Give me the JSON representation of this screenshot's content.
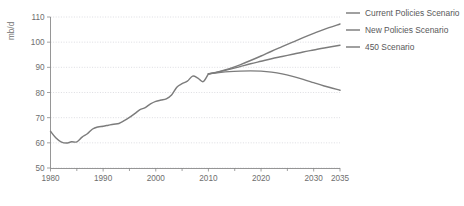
{
  "chart_data": {
    "type": "line",
    "title": "",
    "xlabel": "",
    "ylabel": "mb/d",
    "xlim": [
      1980,
      2035
    ],
    "ylim": [
      50,
      110
    ],
    "xticks": [
      1980,
      1990,
      2000,
      2010,
      2020,
      2030,
      2035
    ],
    "yticks": [
      50,
      60,
      70,
      80,
      90,
      100,
      110
    ],
    "xtick_labels": [
      "1980",
      "1990",
      "2000",
      "2010",
      "2020",
      "2030",
      "2035"
    ],
    "ytick_labels": [
      "50",
      "60",
      "70",
      "80",
      "90",
      "100",
      "110"
    ],
    "xminor_ticks": [
      1985,
      1995,
      2005,
      2015,
      2025
    ],
    "grid": "horizontal-dotted",
    "legend_position": "right",
    "line_color": "#7c7c7c",
    "grid_color": "#cfcfd6",
    "axis_color": "#8a8a8a",
    "text_color": "#6e6e6e",
    "series": [
      {
        "name": "Current Policies Scenario",
        "x": [
          2010,
          2012,
          2014,
          2016,
          2018,
          2020,
          2022,
          2024,
          2026,
          2028,
          2030,
          2032,
          2035
        ],
        "values": [
          87.4,
          88.3,
          89.5,
          91.0,
          92.7,
          94.5,
          96.4,
          98.2,
          100.0,
          101.8,
          103.5,
          105.1,
          107.2
        ]
      },
      {
        "name": "New Policies Scenario",
        "x": [
          2010,
          2012,
          2014,
          2016,
          2018,
          2020,
          2022,
          2024,
          2026,
          2028,
          2030,
          2032,
          2035
        ],
        "values": [
          87.4,
          88.2,
          89.2,
          90.3,
          91.4,
          92.4,
          93.4,
          94.3,
          95.2,
          96.1,
          96.9,
          97.7,
          98.8
        ]
      },
      {
        "name": "450 Scenario",
        "x": [
          2010,
          2012,
          2014,
          2016,
          2018,
          2020,
          2022,
          2024,
          2026,
          2028,
          2030,
          2032,
          2035
        ],
        "values": [
          87.4,
          87.9,
          88.3,
          88.5,
          88.6,
          88.5,
          88.1,
          87.4,
          86.4,
          85.2,
          83.9,
          82.6,
          80.9
        ]
      },
      {
        "name": "Historical",
        "x": [
          1980,
          1981,
          1982,
          1983,
          1984,
          1985,
          1986,
          1987,
          1988,
          1989,
          1990,
          1991,
          1992,
          1993,
          1994,
          1995,
          1996,
          1997,
          1998,
          1999,
          2000,
          2001,
          2002,
          2003,
          2004,
          2005,
          2006,
          2007,
          2008,
          2009,
          2010
        ],
        "values": [
          64.6,
          62.0,
          60.4,
          59.9,
          60.4,
          60.4,
          62.3,
          63.6,
          65.5,
          66.3,
          66.6,
          67.0,
          67.4,
          67.7,
          68.8,
          70.1,
          71.6,
          73.2,
          74.0,
          75.5,
          76.5,
          77.0,
          77.5,
          79.0,
          82.1,
          83.5,
          84.5,
          86.5,
          85.7,
          84.3,
          87.4
        ]
      }
    ]
  },
  "axis": {
    "y_title": "mb/d"
  },
  "legend": {
    "items": [
      {
        "label": "Current Policies Scenario"
      },
      {
        "label": "New Policies Scenario"
      },
      {
        "label": "450 Scenario"
      }
    ]
  }
}
